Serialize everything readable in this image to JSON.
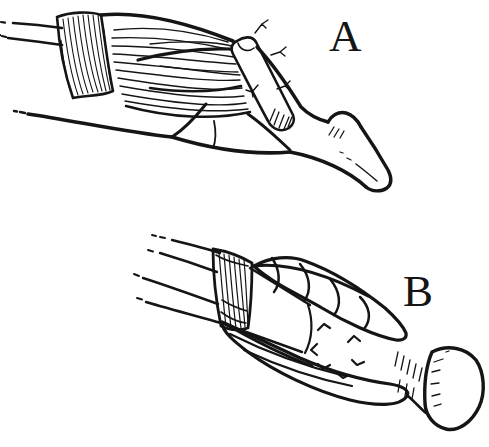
{
  "canvas": {
    "width": 489,
    "height": 447,
    "background_color": "#ffffff",
    "ink_color": "#151515"
  },
  "figure": {
    "style": "hand-drawn surgical line illustration, black ink on white",
    "panels": [
      {
        "label": "A",
        "parts": [
          "proximal-tendon",
          "retinaculum-band",
          "muscle-belly",
          "crossing-tendon-strip",
          "nerve-twigs",
          "phalanx-bone"
        ]
      },
      {
        "label": "B",
        "parts": [
          "proximal-tendons",
          "retinaculum-band",
          "upper-muscle-bundle",
          "lower-muscle-bundle",
          "tendon-graft-shaft",
          "suture-marks",
          "bone-head"
        ]
      }
    ]
  }
}
